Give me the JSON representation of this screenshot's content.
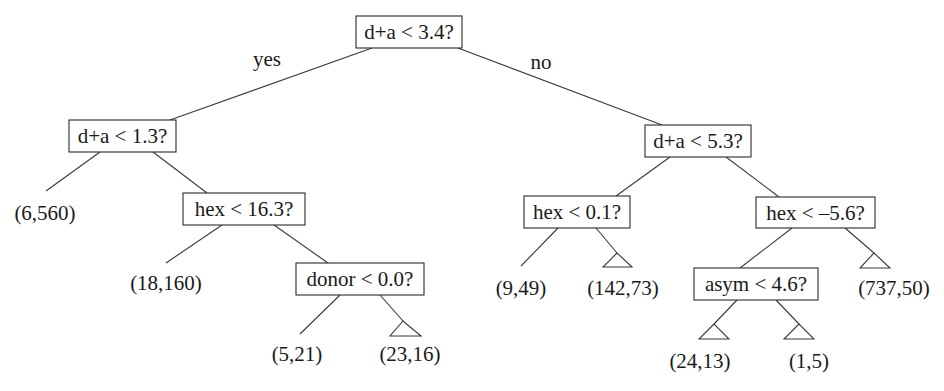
{
  "diagram": {
    "type": "decision-tree",
    "branch_labels": {
      "yes": "yes",
      "no": "no"
    },
    "nodes": [
      {
        "id": "root",
        "label": "d+a < 3.4?",
        "box": [
          356,
          16,
          106,
          32
        ]
      },
      {
        "id": "n_da13",
        "label": "d+a < 1.3?",
        "box": [
          69,
          120,
          107,
          32
        ]
      },
      {
        "id": "n_hex163",
        "label": "hex < 16.3?",
        "box": [
          183,
          193,
          122,
          32
        ]
      },
      {
        "id": "n_donor00",
        "label": "donor < 0.0?",
        "box": [
          296,
          263,
          128,
          32
        ]
      },
      {
        "id": "n_da53",
        "label": "d+a < 5.3?",
        "box": [
          645,
          125,
          106,
          32
        ]
      },
      {
        "id": "n_hex01",
        "label": "hex < 0.1?",
        "box": [
          524,
          196,
          106,
          32
        ]
      },
      {
        "id": "n_hexm56",
        "label": "hex < –5.6?",
        "box": [
          756,
          197,
          119,
          31
        ]
      },
      {
        "id": "n_asym46",
        "label": "asym < 4.6?",
        "box": [
          694,
          268,
          124,
          32
        ]
      }
    ],
    "leaves": [
      {
        "id": "leaf_6_560",
        "label": "(6,560)",
        "subtree": false,
        "x": 45,
        "y": 220
      },
      {
        "id": "leaf_18_160",
        "label": "(18,160)",
        "subtree": false,
        "x": 166,
        "y": 290
      },
      {
        "id": "leaf_5_21",
        "label": "(5,21)",
        "subtree": false,
        "x": 297,
        "y": 361
      },
      {
        "id": "leaf_23_16",
        "label": "(23,16)",
        "subtree": true,
        "x": 410,
        "y": 361
      },
      {
        "id": "leaf_9_49",
        "label": "(9,49)",
        "subtree": false,
        "x": 521,
        "y": 295
      },
      {
        "id": "leaf_142_73",
        "label": "(142,73)",
        "subtree": true,
        "x": 623,
        "y": 295
      },
      {
        "id": "leaf_24_13",
        "label": "(24,13)",
        "subtree": true,
        "x": 700,
        "y": 368
      },
      {
        "id": "leaf_1_5",
        "label": "(1,5)",
        "subtree": true,
        "x": 809,
        "y": 368
      },
      {
        "id": "leaf_737_50",
        "label": "(737,50)",
        "subtree": true,
        "x": 894,
        "y": 295
      }
    ]
  }
}
